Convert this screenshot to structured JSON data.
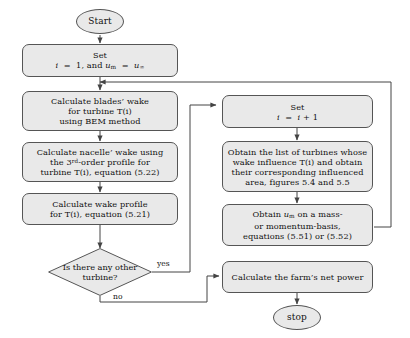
{
  "diagram": {
    "colors": {
      "node_fill": "#e9e9e9",
      "node_border": "#555555",
      "line": "#444444",
      "text": "#111111",
      "background": "#ffffff"
    },
    "nodes": {
      "start": {
        "label": "Start",
        "shape": "terminator"
      },
      "set_init": {
        "shape": "process",
        "lines": [
          "Set",
          "i  =  1, and uₘ  =  u∞"
        ],
        "line1": "Set",
        "line2_plain": "i = 1, and u_m = u_inf"
      },
      "blades_wake": {
        "shape": "process",
        "lines": [
          "Calculate blades’ wake",
          "for turbine T(i)",
          "using BEM method"
        ]
      },
      "nacelle_wake": {
        "shape": "process",
        "lines": [
          "Calculate nacelle’ wake using",
          "the 3ʳᵈ-order profile for",
          "turbine T(i), equation (5.22)"
        ],
        "line2_parts": {
          "pre": "the 3",
          "sup": "rd",
          "post": "-order profile for"
        }
      },
      "wake_profile": {
        "shape": "process",
        "lines": [
          "Calculate wake profile",
          "for T(i), equation (5.21)"
        ]
      },
      "decision": {
        "shape": "decision",
        "lines": [
          "Is there any",
          "other turbine?"
        ],
        "yes_label": "yes",
        "no_label": "no"
      },
      "set_incr": {
        "shape": "process",
        "lines": [
          "Set",
          "i  =  i + 1"
        ],
        "line1": "Set",
        "line2_plain": "i = i + 1"
      },
      "obtain_list": {
        "shape": "process",
        "lines": [
          "Obtain the list of turbines whose",
          "wake influence T(i) and obtain",
          "their corresponding influenced",
          "area, figures 5.4 and 5.5"
        ]
      },
      "obtain_um": {
        "shape": "process",
        "lines": [
          "Obtain uₘ on a mass-",
          "or momentum-basis,",
          "equations (5.51) or (5.52)"
        ]
      },
      "net_power": {
        "shape": "process",
        "lines": [
          "Calculate the farm’s net power"
        ]
      },
      "stop": {
        "label": "stop",
        "shape": "terminator"
      }
    }
  }
}
